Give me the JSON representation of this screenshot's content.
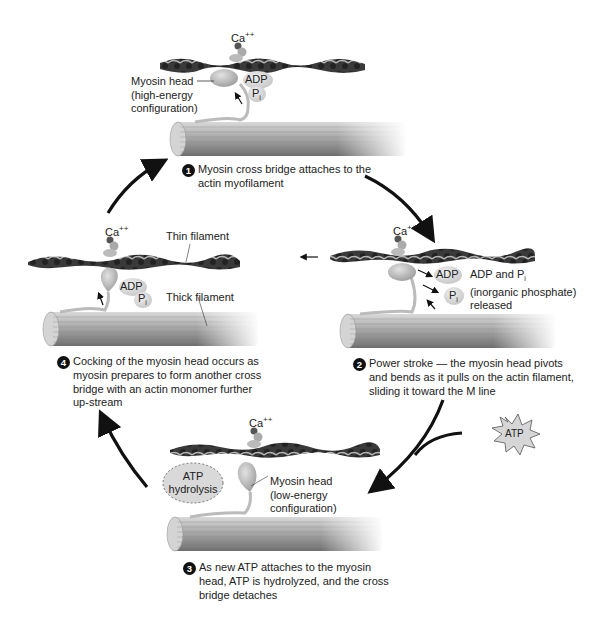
{
  "diagram": {
    "type": "cycle",
    "title_visible": false,
    "cycle_direction": "clockwise",
    "colors": {
      "background": "#ffffff",
      "arrow": "#111111",
      "actin_dark": "#2b2b2b",
      "actin_light": "#9a9a9a",
      "myosin_head": "#b8b8b8",
      "thick_filament": "#8f8f8f",
      "step_badge": "#111111",
      "atp_star": "#cfcfcf"
    },
    "stages": [
      {
        "number": "1",
        "position": "top",
        "calcium_label": "Ca",
        "calcium_charge": "++",
        "description": "Myosin cross bridge attaches to the actin myofilament",
        "description_lines": [
          "Myosin cross bridge attaches to the",
          "actin myofilament"
        ],
        "head_label_lines": [
          "Myosin head",
          "(high-energy",
          "configuration)"
        ],
        "molecules": [
          "ADP",
          "P",
          "i"
        ]
      },
      {
        "number": "2",
        "position": "right",
        "calcium_label": "Ca",
        "calcium_charge": "++",
        "description": "Power stroke — the myosin head pivots and bends as it pulls on the actin filament, sliding it toward the M line",
        "description_lines": [
          "Power stroke — the myosin head pivots",
          "and bends as it pulls on the actin filament,",
          "sliding it toward the M line"
        ],
        "release_label_lines": [
          "ADP and P",
          "(inorganic phosphate)",
          "released"
        ],
        "release_sub": "i",
        "molecules": [
          "ADP",
          "P",
          "i"
        ]
      },
      {
        "number": "3",
        "position": "bottom",
        "calcium_label": "Ca",
        "calcium_charge": "++",
        "description": "As new ATP attaches to the myosin head, ATP is hydrolyzed, and the cross bridge detaches",
        "description_lines": [
          "As new ATP attaches to the myosin",
          "head, ATP is hydrolyzed, and the cross",
          "bridge detaches"
        ],
        "head_label_lines": [
          "Myosin head",
          "(low-energy",
          "configuration)"
        ],
        "oval_label_lines": [
          "ATP",
          "hydrolysis"
        ],
        "input_molecule": "ATP"
      },
      {
        "number": "4",
        "position": "left",
        "calcium_label": "Ca",
        "calcium_charge": "++",
        "description": "Cocking of the myosin head occurs as myosin prepares to form another cross bridge with an actin monomer further up-stream",
        "description_lines": [
          "Cocking of the myosin head occurs as",
          "myosin prepares to form another cross",
          "bridge with an actin monomer further",
          "up-stream"
        ],
        "thin_filament_label": "Thin filament",
        "thick_filament_label": "Thick filament",
        "molecules": [
          "ADP",
          "P",
          "i"
        ]
      }
    ],
    "arrows": [
      {
        "from": "4",
        "to": "1",
        "side": "upper-left"
      },
      {
        "from": "1",
        "to": "2",
        "side": "upper-right"
      },
      {
        "from": "2",
        "to": "3",
        "side": "lower-right",
        "joined_by": "ATP"
      },
      {
        "from": "3",
        "to": "4",
        "side": "lower-left"
      }
    ],
    "filament_motion_arrow": "left",
    "bottom_caption_clipped": true
  }
}
